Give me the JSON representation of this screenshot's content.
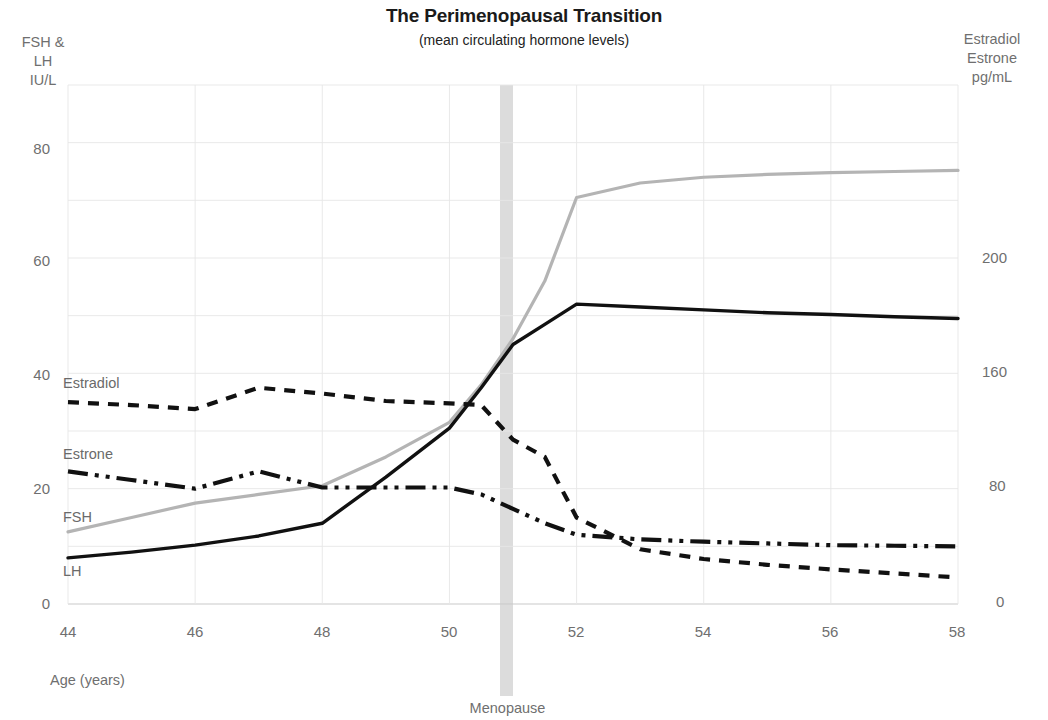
{
  "chart_data": {
    "type": "line",
    "title": "The Perimenopausal Transition",
    "subtitle": "(mean circulating hormone levels)",
    "xlabel": "Age (years)",
    "ylabel_left": "FSH &\nLH\nIU/L",
    "ylabel_right": "Estradiol\nEstrone\npg/mL",
    "x": [
      44,
      45,
      46,
      47,
      48,
      49,
      50,
      50.5,
      51,
      51.5,
      52,
      53,
      54,
      55,
      56,
      57,
      58
    ],
    "xlim": [
      44,
      58
    ],
    "xticks": [
      "44",
      "46",
      "48",
      "50",
      "52",
      "54",
      "56",
      "58"
    ],
    "ylim_left": [
      0,
      90
    ],
    "yticks_left": [
      "0",
      "20",
      "40",
      "60",
      "80"
    ],
    "ylim_right": [
      0,
      245
    ],
    "yticks_right": [
      "0",
      "80",
      "160",
      "200"
    ],
    "grid": true,
    "legend_position": "inline-left",
    "annotations": [
      {
        "label": "Menopause",
        "x": 51,
        "type": "vertical-band"
      }
    ],
    "series": [
      {
        "name": "Estradiol",
        "axis": "right",
        "style": "dotted",
        "color": "#111111",
        "values_left_scale": [
          35.0,
          34.5,
          33.8,
          37.5,
          36.5,
          35.2,
          34.8,
          34.5,
          28.5,
          25.5,
          15.0,
          9.5,
          7.8,
          6.8,
          6.0,
          5.3,
          4.6
        ],
        "values": [
          140,
          138,
          135,
          150,
          146,
          141,
          139,
          138,
          114,
          102,
          60,
          38,
          31,
          27,
          24,
          21,
          18
        ]
      },
      {
        "name": "Estrone",
        "axis": "right",
        "style": "dash-dot-dot",
        "color": "#111111",
        "values_left_scale": [
          23.0,
          21.5,
          20.0,
          23.0,
          20.2,
          20.2,
          20.2,
          19.0,
          16.5,
          14.0,
          12.0,
          11.2,
          10.8,
          10.5,
          10.2,
          10.1,
          10.0
        ],
        "values": [
          92,
          86,
          80,
          92,
          81,
          81,
          81,
          76,
          66,
          56,
          48,
          45,
          43,
          42,
          41,
          40,
          40
        ]
      },
      {
        "name": "FSH",
        "axis": "left",
        "style": "solid",
        "color": "#b4b4b4",
        "values": [
          12.5,
          15.0,
          17.5,
          19.0,
          20.5,
          25.5,
          31.5,
          38.0,
          46.0,
          56.0,
          70.5,
          73.0,
          74.0,
          74.5,
          74.8,
          75.0,
          75.2
        ]
      },
      {
        "name": "LH",
        "axis": "left",
        "style": "solid",
        "color": "#111111",
        "values": [
          8.0,
          9.0,
          10.2,
          11.8,
          14.0,
          22.0,
          30.5,
          37.5,
          45.0,
          48.5,
          52.0,
          51.5,
          51.0,
          50.5,
          50.2,
          49.8,
          49.5
        ]
      }
    ]
  },
  "labels": {
    "estradiol": "Estradiol",
    "estrone": "Estrone",
    "fsh": "FSH",
    "lh": "LH",
    "menopause": "Menopause",
    "age_axis": "Age (years)"
  }
}
